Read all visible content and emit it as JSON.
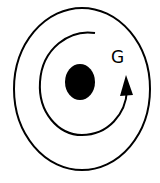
{
  "diagram": {
    "labels": {
      "curve_label": "G"
    },
    "elements": [
      {
        "id": "outer-ellipse",
        "shape": "ellipse",
        "stroke": "#000000"
      },
      {
        "id": "inner-arc",
        "shape": "arc-with-arrowhead",
        "direction": "counterclockwise",
        "stroke": "#000000"
      },
      {
        "id": "center-dot",
        "shape": "filled-ellipse",
        "fill": "#000000"
      }
    ],
    "colors": {
      "line": "#000000",
      "background": "#ffffff"
    }
  }
}
